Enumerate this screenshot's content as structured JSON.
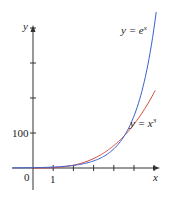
{
  "chart_data": {
    "type": "line",
    "title": "",
    "xlabel": "x",
    "ylabel": "y",
    "x_ticks": [
      1,
      2,
      3,
      4,
      5,
      6
    ],
    "x_tick_labels": [
      "0",
      "1"
    ],
    "y_tick_labels": [
      "100"
    ],
    "y_ticks": [
      100,
      200,
      300,
      400
    ],
    "xlim": [
      -1.5,
      7
    ],
    "ylim": [
      -70,
      430
    ],
    "series": [
      {
        "name": "y = e^x",
        "color": "#3a5fcd",
        "function": "exp(x)",
        "x": [
          0,
          1,
          2,
          3,
          4,
          4.54,
          5,
          5.5,
          6
        ],
        "values": [
          1,
          2.72,
          7.39,
          20.1,
          54.6,
          93.7,
          148.4,
          244.7,
          403.4
        ]
      },
      {
        "name": "y = x^3",
        "color": "#d8453a",
        "function": "x^3",
        "x": [
          0,
          1,
          2,
          3,
          4,
          4.54,
          5,
          5.5,
          6
        ],
        "values": [
          0,
          1,
          8,
          27,
          64,
          93.6,
          125,
          166.4,
          216
        ]
      }
    ],
    "annotations": [
      "y = e^x",
      "y = x^3"
    ],
    "grid": false,
    "legend": "none (inline labels)"
  },
  "labels": {
    "y_axis": "y",
    "x_axis": "x",
    "origin": "0",
    "x_one": "1",
    "y_hundred": "100",
    "exp_label_base": "y = e",
    "exp_label_sup": "x",
    "cube_label_base": "y = x",
    "cube_label_sup": "3"
  }
}
